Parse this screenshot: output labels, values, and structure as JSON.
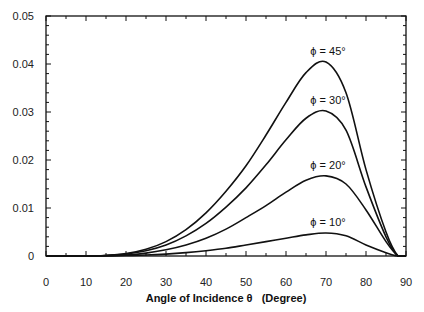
{
  "chart_data": {
    "type": "line",
    "title": "",
    "xlabel": "Angle of Incidence θ   (Degree)",
    "ylabel": "",
    "xlim": [
      0,
      90
    ],
    "ylim": [
      0,
      0.05
    ],
    "x_ticks": [
      0,
      10,
      20,
      30,
      40,
      50,
      60,
      70,
      80,
      90
    ],
    "x_tick_labels": [
      "0",
      "10",
      "20",
      "30",
      "40",
      "50",
      "60",
      "70",
      "80",
      "90"
    ],
    "y_ticks": [
      0,
      0.01,
      0.02,
      0.03,
      0.04,
      0.05
    ],
    "y_tick_labels": [
      "0",
      "0.01",
      "0.02",
      "0.03",
      "0.04",
      "0.05"
    ],
    "grid": false,
    "legend_position": "inline labels at curve peaks",
    "x": [
      0,
      10,
      15,
      20,
      25,
      30,
      35,
      40,
      45,
      50,
      55,
      60,
      65,
      70,
      75,
      80,
      85,
      88,
      90
    ],
    "series": [
      {
        "name": "φ = 45°",
        "label": "ϕ = 45°",
        "values": [
          0,
          0,
          0.0001,
          0.0005,
          0.0014,
          0.003,
          0.0055,
          0.009,
          0.0135,
          0.0188,
          0.0252,
          0.032,
          0.0382,
          0.0404,
          0.034,
          0.018,
          0.005,
          0,
          0
        ]
      },
      {
        "name": "φ = 30°",
        "label": "ϕ = 30°",
        "values": [
          0,
          0,
          0.0001,
          0.0004,
          0.0011,
          0.0023,
          0.0042,
          0.0068,
          0.0102,
          0.0142,
          0.019,
          0.0242,
          0.0287,
          0.0302,
          0.0262,
          0.0144,
          0.004,
          0,
          0
        ]
      },
      {
        "name": "φ = 20°",
        "label": "ϕ = 20°",
        "values": [
          0,
          0,
          0.0001,
          0.0002,
          0.0006,
          0.0013,
          0.0023,
          0.0037,
          0.0056,
          0.008,
          0.0105,
          0.0133,
          0.0158,
          0.0167,
          0.015,
          0.0096,
          0.003,
          0,
          0
        ]
      },
      {
        "name": "φ = 10°",
        "label": "ϕ = 10°",
        "values": [
          0,
          0,
          0,
          0.0001,
          0.0002,
          0.0004,
          0.0007,
          0.0011,
          0.0016,
          0.0023,
          0.003,
          0.0037,
          0.0044,
          0.0048,
          0.0042,
          0.0023,
          0.0007,
          0,
          0
        ]
      }
    ],
    "annotations": [
      {
        "text": "ϕ = 45°",
        "x": 70,
        "y": 0.0404
      },
      {
        "text": "ϕ = 30°",
        "x": 70,
        "y": 0.0302
      },
      {
        "text": "ϕ = 20°",
        "x": 70,
        "y": 0.0167
      },
      {
        "text": "ϕ = 10°",
        "x": 70,
        "y": 0.0048
      }
    ]
  }
}
